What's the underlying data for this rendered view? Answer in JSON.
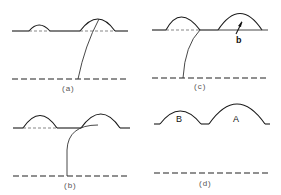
{
  "figure": {
    "panels": [
      {
        "id": "a",
        "caption": "(a)",
        "description": "Two droplets on surface, small left and larger right; a curved line descends from the top of the right droplet to the lower dashed line."
      },
      {
        "id": "b",
        "caption": "(b)",
        "description": "Two droplets on surface; a curved line runs from under the right droplet and bends down to the lower dashed line."
      },
      {
        "id": "c",
        "caption": "(c)",
        "description": "Two droplets on surface; a curved line descends from the junction point between droplets to the lower dashed line; arrow labeled b points into the right droplet base.",
        "arrow_label": "b"
      },
      {
        "id": "d",
        "caption": "(d)",
        "description": "Two adjacent droplets labeled B (smaller, left) and A (larger, right), no connecting line.",
        "labels": [
          "B",
          "A"
        ]
      }
    ]
  }
}
